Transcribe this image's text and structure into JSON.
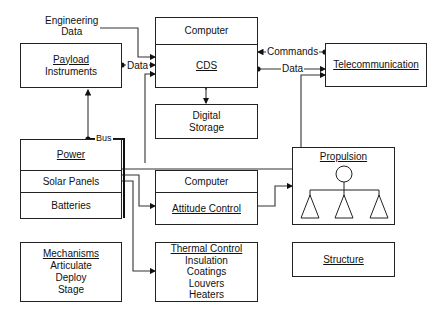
{
  "diagram": {
    "external_input": {
      "line1": "Engineering",
      "line2": "Data"
    },
    "payload": {
      "title": "Payload",
      "subtitle": "Instruments"
    },
    "cds": {
      "header": "Computer",
      "title": "CDS"
    },
    "storage": {
      "line1": "Digital",
      "line2": "Storage"
    },
    "telecom": {
      "title": "Telecommunication"
    },
    "power": {
      "title": "Power",
      "row2": "Solar Panels",
      "row3": "Batteries"
    },
    "attitude": {
      "header": "Computer",
      "title": "Attitude Control"
    },
    "propulsion": {
      "title": "Propulsion"
    },
    "mechanisms": {
      "title": "Mechanisms",
      "items": [
        "Articulate",
        "Deploy",
        "Stage"
      ]
    },
    "thermal": {
      "title": "Thermal Control",
      "items": [
        "Insulation",
        "Coatings",
        "Louvers",
        "Heaters"
      ]
    },
    "structure": {
      "title": "Structure"
    },
    "labels": {
      "payload_data": "Data",
      "cds_data_out": "Data",
      "commands": "Commands",
      "bus": "Bus"
    }
  }
}
